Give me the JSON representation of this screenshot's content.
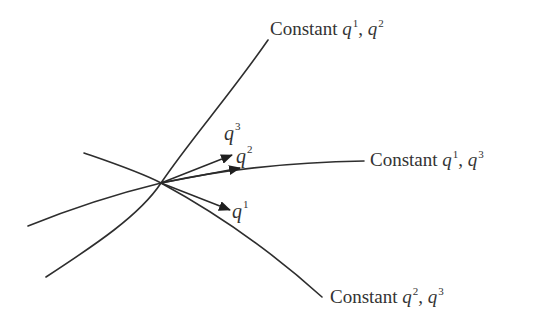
{
  "diagram": {
    "curves": [
      {
        "id": "const-q1-q2",
        "label_prefix": "Constant",
        "var_a": "q",
        "sup_a": "1",
        "sep": ", ",
        "var_b": "q",
        "sup_b": "2"
      },
      {
        "id": "const-q1-q3",
        "label_prefix": "Constant",
        "var_a": "q",
        "sup_a": "1",
        "sep": ", ",
        "var_b": "q",
        "sup_b": "3"
      },
      {
        "id": "const-q2-q3",
        "label_prefix": "Constant",
        "var_a": "q",
        "sup_a": "2",
        "sep": ", ",
        "var_b": "q",
        "sup_b": "3"
      }
    ],
    "vectors": [
      {
        "id": "q3",
        "var": "q",
        "sup": "3"
      },
      {
        "id": "q2",
        "var": "q",
        "sup": "2"
      },
      {
        "id": "q1",
        "var": "q",
        "sup": "1"
      }
    ],
    "colors": {
      "stroke": "#2e2e2e",
      "text": "#333333",
      "background": "#ffffff"
    }
  }
}
